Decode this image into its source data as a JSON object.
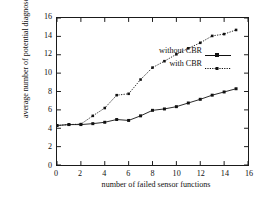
{
  "chart_data": {
    "type": "line",
    "title": "",
    "xlabel": "number of failed sensor functions",
    "ylabel": "average number of potential diagnoses",
    "xlim": [
      0,
      16
    ],
    "ylim": [
      0,
      16
    ],
    "xticks": [
      0,
      2,
      4,
      6,
      8,
      10,
      12,
      14,
      16
    ],
    "yticks": [
      0,
      2,
      4,
      6,
      8,
      10,
      12,
      14,
      16
    ],
    "grid": false,
    "legend_position": "upper-left-inside",
    "x": [
      0,
      1,
      2,
      3,
      4,
      5,
      6,
      7,
      8,
      9,
      10,
      11,
      12,
      13,
      14,
      15
    ],
    "series": [
      {
        "name": "without CBR",
        "line_style": "solid",
        "marker": "filled-square",
        "color": "#111111",
        "values": [
          4.3,
          4.4,
          4.4,
          4.5,
          4.65,
          4.95,
          4.85,
          5.35,
          5.95,
          6.1,
          6.35,
          6.75,
          7.15,
          7.6,
          7.95,
          8.3
        ]
      },
      {
        "name": "with CBR",
        "line_style": "dotted",
        "marker": "filled-square",
        "color": "#111111",
        "values": [
          4.3,
          4.4,
          4.45,
          5.35,
          6.2,
          7.6,
          7.75,
          9.3,
          10.6,
          11.3,
          12.05,
          12.7,
          13.3,
          14.05,
          14.25,
          14.7
        ]
      }
    ]
  },
  "legend": {
    "entries": [
      {
        "label": "without CBR"
      },
      {
        "label": "with CBR"
      }
    ]
  },
  "axes": {
    "y_title": "average number of potential diagnoses",
    "x_title": "number of failed sensor functions",
    "y_tick_labels": [
      "0",
      "2",
      "4",
      "6",
      "8",
      "10",
      "12",
      "14",
      "16"
    ],
    "x_tick_labels": [
      "0",
      "2",
      "4",
      "6",
      "8",
      "10",
      "12",
      "14",
      "16"
    ]
  },
  "colors": {
    "axis": "#1a1a1a",
    "series": "#111111",
    "background": "#ffffff"
  }
}
